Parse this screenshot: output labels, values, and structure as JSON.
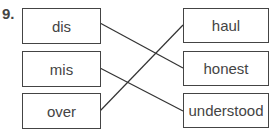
{
  "question_number": "9.",
  "left_items": [
    "dis",
    "mis",
    "over"
  ],
  "right_items": [
    "haul",
    "honest",
    "understood"
  ],
  "connections": [
    {
      "from": "dis",
      "to": "honest"
    },
    {
      "from": "mis",
      "to": "understood"
    },
    {
      "from": "over",
      "to": "haul"
    }
  ]
}
